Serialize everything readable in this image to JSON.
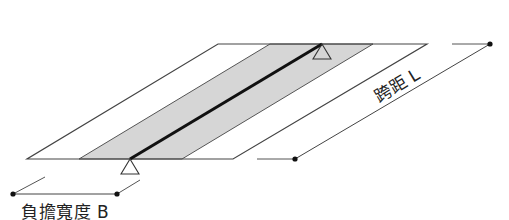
{
  "diagram": {
    "type": "slab strip load-width diagram",
    "labels": {
      "tributary_width": "負擔寬度 B",
      "span": "跨距 L"
    },
    "colors": {
      "outline": "#333333",
      "load_strip_fill": "#d4d4d4",
      "beam_line": "#111111",
      "dimension_line": "#444444"
    },
    "elements": [
      "slab-parallelogram",
      "shaded-tributary-strip",
      "beam-centerline",
      "support-triangle-near",
      "support-triangle-far",
      "span-dimension-line",
      "width-dimension-line"
    ]
  }
}
